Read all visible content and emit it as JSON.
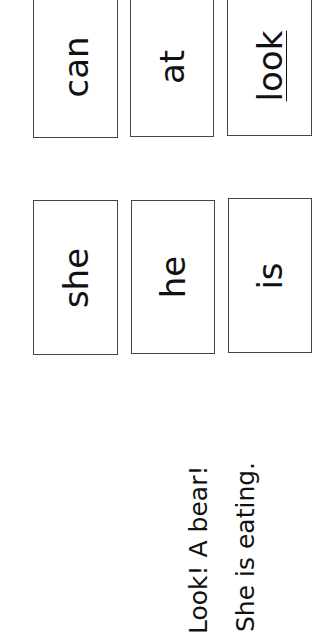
{
  "cards": [
    {
      "word": "can"
    },
    {
      "word": "at"
    },
    {
      "word": "look"
    },
    {
      "word": "she"
    },
    {
      "word": "he"
    },
    {
      "word": "is"
    }
  ],
  "sentences": [
    {
      "text": "Look! A bear!"
    },
    {
      "text": "She is eating."
    }
  ]
}
